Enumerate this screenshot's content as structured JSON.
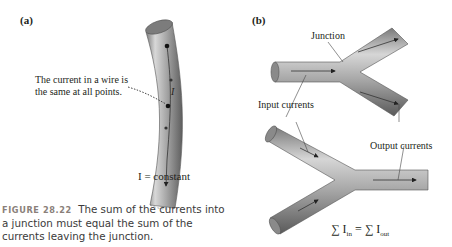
{
  "figure": {
    "panel_a": {
      "label": "(a)",
      "annotation_line1": "The current in a wire is",
      "annotation_line2": "the same at all points.",
      "current_symbol": "I",
      "equation": "I = constant"
    },
    "panel_b": {
      "label": "(b)",
      "junction_label": "Junction",
      "input_label": "Input currents",
      "output_label": "Output currents",
      "equation_lhs": "∑ I",
      "equation_lhs_sub": "in",
      "equation_mid": " = ∑ I",
      "equation_rhs_sub": "out"
    },
    "caption": {
      "number": "FIGURE 28.22",
      "text": "The sum of the currents into a junction must equal the sum of the currents leaving the junction."
    },
    "colors": {
      "wire_light": "#c9c9c9",
      "wire_mid": "#9a9a9a",
      "wire_dark": "#6e6e6e",
      "text": "#231f20",
      "caption_number": "#8a7f7a"
    }
  }
}
